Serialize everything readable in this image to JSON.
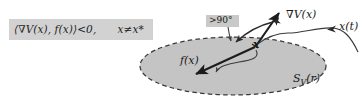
{
  "figure": {
    "type": "diagram",
    "background_color": "#ffffff",
    "width": 363,
    "height": 102
  },
  "formula": {
    "text": "⟨∇V(x), f(x)⟩<0,  x≠x*",
    "box_color": "#d2d2d2",
    "text_color": "#1f1f1f"
  },
  "angle": {
    "label": ">90°",
    "box_color": "#c9c9c9",
    "text_color": "#161616"
  },
  "labels": {
    "gradient": "∇V(x)",
    "trajectory": "x(t)",
    "vector_field": "f(x)",
    "point": "x",
    "level_set": "S",
    "level_set_sub": "V",
    "level_set_arg": "(r)"
  },
  "region": {
    "name": "level-set-ellipse",
    "fill_color": "#c4c4c4",
    "border_color": "#3a3a3a",
    "border_style": "dashed"
  },
  "vectors": [
    {
      "name": "gradient-arrow",
      "label": "∇V(x)",
      "direction": "up-right"
    },
    {
      "name": "vector-field-arrow",
      "label": "f(x)",
      "direction": "down-left"
    },
    {
      "name": "trajectory-arrow",
      "label": "x(t)",
      "direction": "left"
    }
  ]
}
